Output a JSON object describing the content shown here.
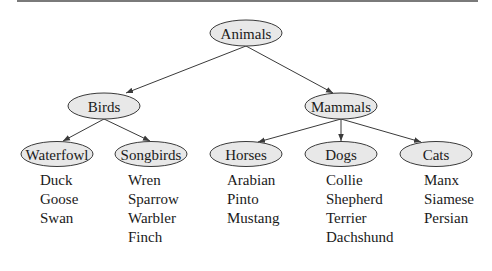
{
  "diagram": {
    "type": "tree",
    "root": "Animals",
    "nodes": {
      "animals": {
        "label": "Animals"
      },
      "birds": {
        "label": "Birds"
      },
      "mammals": {
        "label": "Mammals"
      },
      "waterfowl": {
        "label": "Waterfowl"
      },
      "songbirds": {
        "label": "Songbirds"
      },
      "horses": {
        "label": "Horses"
      },
      "dogs": {
        "label": "Dogs"
      },
      "cats": {
        "label": "Cats"
      }
    },
    "edges": [
      [
        "Animals",
        "Birds"
      ],
      [
        "Animals",
        "Mammals"
      ],
      [
        "Birds",
        "Waterfowl"
      ],
      [
        "Birds",
        "Songbirds"
      ],
      [
        "Mammals",
        "Horses"
      ],
      [
        "Mammals",
        "Dogs"
      ],
      [
        "Mammals",
        "Cats"
      ]
    ],
    "leaves": {
      "waterfowl": [
        "Duck",
        "Goose",
        "Swan"
      ],
      "songbirds": [
        "Wren",
        "Sparrow",
        "Warbler",
        "Finch"
      ],
      "horses": [
        "Arabian",
        "Pinto",
        "Mustang"
      ],
      "dogs": [
        "Collie",
        "Shepherd",
        "Terrier",
        "Dachshund"
      ],
      "cats": [
        "Manx",
        "Siamese",
        "Persian"
      ]
    }
  },
  "colors": {
    "node_fill": "#e8e8e8",
    "stroke": "#3a3a3a",
    "rule": "#7a7a7a"
  }
}
